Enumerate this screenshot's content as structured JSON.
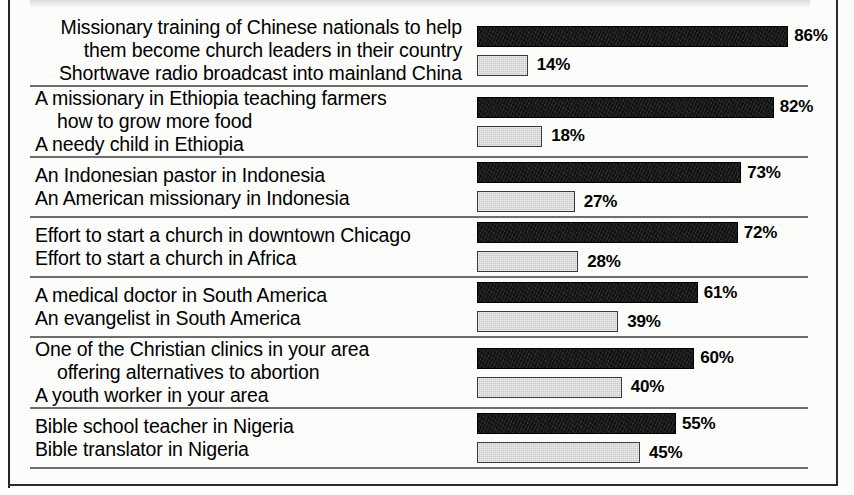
{
  "chart_data": {
    "type": "bar",
    "title": "",
    "subtitle": "",
    "xlabel": "",
    "ylabel": "",
    "xlim": [
      0,
      100
    ],
    "grid": false,
    "legend": null,
    "unit": "%",
    "orientation": "horizontal",
    "note": "Paired head-to-head preference items; each pair sums to 100%.",
    "pairs": [
      {
        "id": "china",
        "option_a": {
          "label_lines": [
            "Missionary training of Chinese nationals to help",
            "them become church leaders in their country"
          ],
          "value": 86,
          "value_label": "86%",
          "style": "dark"
        },
        "option_b": {
          "label_lines": [
            "Shortwave radio broadcast into mainland China"
          ],
          "value": 14,
          "value_label": "14%",
          "style": "light"
        }
      },
      {
        "id": "ethiopia",
        "option_a": {
          "label_lines": [
            "A missionary in Ethiopia teaching farmers",
            "how to grow more food"
          ],
          "value": 82,
          "value_label": "82%",
          "style": "dark"
        },
        "option_b": {
          "label_lines": [
            "A needy child in Ethiopia"
          ],
          "value": 18,
          "value_label": "18%",
          "style": "light"
        }
      },
      {
        "id": "indonesia",
        "option_a": {
          "label_lines": [
            "An Indonesian pastor in Indonesia"
          ],
          "value": 73,
          "value_label": "73%",
          "style": "dark"
        },
        "option_b": {
          "label_lines": [
            "An American missionary in Indonesia"
          ],
          "value": 27,
          "value_label": "27%",
          "style": "light"
        }
      },
      {
        "id": "chicago-africa",
        "option_a": {
          "label_lines": [
            "Effort to start a church in downtown Chicago"
          ],
          "value": 72,
          "value_label": "72%",
          "style": "dark"
        },
        "option_b": {
          "label_lines": [
            "Effort to start a church in Africa"
          ],
          "value": 28,
          "value_label": "28%",
          "style": "light"
        }
      },
      {
        "id": "south-america",
        "option_a": {
          "label_lines": [
            "A medical doctor in South America"
          ],
          "value": 61,
          "value_label": "61%",
          "style": "dark"
        },
        "option_b": {
          "label_lines": [
            "An evangelist in South America"
          ],
          "value": 39,
          "value_label": "39%",
          "style": "light"
        }
      },
      {
        "id": "your-area",
        "option_a": {
          "label_lines": [
            "One of the Christian clinics in your area",
            "offering alternatives to abortion"
          ],
          "value": 60,
          "value_label": "60%",
          "style": "dark"
        },
        "option_b": {
          "label_lines": [
            "A youth worker in your area"
          ],
          "value": 40,
          "value_label": "40%",
          "style": "light"
        }
      },
      {
        "id": "nigeria",
        "option_a": {
          "label_lines": [
            "Bible school teacher in Nigeria"
          ],
          "value": 55,
          "value_label": "55%",
          "style": "dark"
        },
        "option_b": {
          "label_lines": [
            "Bible translator in Nigeria"
          ],
          "value": 45,
          "value_label": "45%",
          "style": "light"
        }
      }
    ]
  },
  "colors": {
    "bar_dark": "#111111",
    "bar_light": "#c9c9c9",
    "rule": "#6e6e6e",
    "frame": "#2b2b2b",
    "text": "#000000",
    "page": "#fdfdfc"
  },
  "scale": {
    "px_per_percent": 3.62,
    "bar_origin_x": 481
  }
}
